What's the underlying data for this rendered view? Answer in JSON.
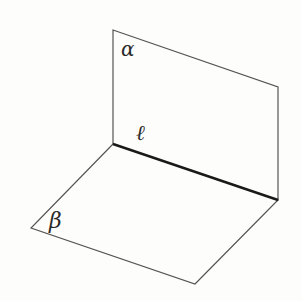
{
  "diagram": {
    "title": "",
    "planes": [
      {
        "id": "alpha",
        "label": "α",
        "points": [
          [
            113,
            30
          ],
          [
            278,
            87
          ],
          [
            278,
            200
          ],
          [
            113,
            144
          ]
        ],
        "label_pos": [
          121,
          56
        ]
      },
      {
        "id": "beta",
        "label": "β",
        "points": [
          [
            113,
            144
          ],
          [
            278,
            200
          ],
          [
            195,
            284
          ],
          [
            31,
            228
          ]
        ],
        "label_pos": [
          49,
          228
        ]
      }
    ],
    "intersection_line": {
      "label": "ℓ",
      "from": [
        113,
        144
      ],
      "to": [
        278,
        200
      ],
      "label_pos": [
        136,
        140
      ]
    },
    "colors": {
      "stroke": "#555555",
      "line_l": "#1a1a1a",
      "background": "#fdfdfb",
      "text": "#2a2a2a"
    }
  }
}
